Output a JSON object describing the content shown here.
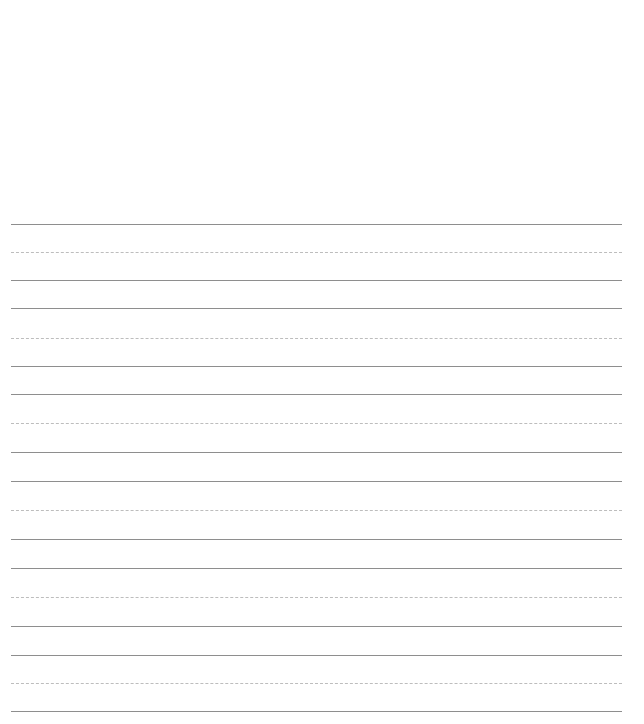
{
  "sheet": {
    "type": "handwriting-practice-paper",
    "line_color_solid": "#8e8e8e",
    "line_color_dashed": "#bdbdbd",
    "line_groups": [
      {
        "top": 224,
        "mid": 252,
        "base": 280
      },
      {
        "top": 308,
        "mid": 338,
        "base": 366
      },
      {
        "top": 394,
        "mid": 423,
        "base": 452
      },
      {
        "top": 481,
        "mid": 510,
        "base": 539
      },
      {
        "top": 568,
        "mid": 597,
        "base": 626
      },
      {
        "top": 655,
        "mid": 683,
        "base": 711
      }
    ]
  }
}
